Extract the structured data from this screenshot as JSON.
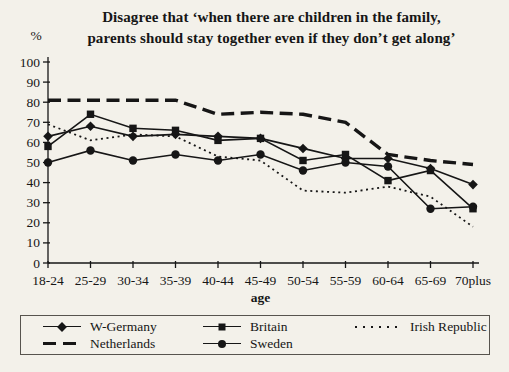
{
  "figure": {
    "title_lines": [
      "Disagree that ‘when there are children in the family,",
      "parents should stay together even if they don’t get along’"
    ]
  },
  "chart_data": {
    "type": "line",
    "title": "Disagree that ‘when there are children in the family, parents should stay together even if they don’t get along’",
    "ylabel": "%",
    "xlabel": "age",
    "ylim": [
      0,
      100
    ],
    "ytick_step": 10,
    "grid": false,
    "legend_position": "bottom",
    "ink_color": "#161616",
    "background_color": "#f3f1ea",
    "categories": [
      "18-24",
      "25-29",
      "30-34",
      "35-39",
      "40-44",
      "45-49",
      "50-54",
      "55-59",
      "60-64",
      "65-69",
      "70plus"
    ],
    "series": [
      {
        "name": "W-Germany",
        "line": "solid",
        "marker": "diamond",
        "values": [
          63,
          68,
          63,
          64,
          63,
          62,
          57,
          52,
          52,
          47,
          39
        ]
      },
      {
        "name": "Britain",
        "line": "solid",
        "marker": "square",
        "values": [
          58,
          74,
          67,
          66,
          61,
          62,
          51,
          54,
          41,
          46,
          27
        ]
      },
      {
        "name": "Irish Republic",
        "line": "dotted",
        "marker": "none",
        "values": [
          69,
          61,
          64,
          63,
          53,
          51,
          36,
          35,
          38,
          33,
          18
        ]
      },
      {
        "name": "Netherlands",
        "line": "dashed",
        "marker": "none",
        "values": [
          81,
          81,
          81,
          81,
          74,
          75,
          74,
          70,
          54,
          51,
          49
        ]
      },
      {
        "name": "Sweden",
        "line": "solid",
        "marker": "circle",
        "values": [
          50,
          56,
          51,
          54,
          51,
          54,
          46,
          50,
          48,
          27,
          28
        ]
      }
    ]
  }
}
